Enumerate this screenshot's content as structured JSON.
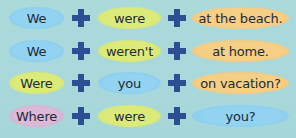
{
  "colors": {
    "background": "#a9d9da",
    "plus": "#2c4f93",
    "blue": "#93d3f2",
    "green": "#dcea7a",
    "orange": "#f6cf86",
    "pink": "#dcb9d8",
    "text": "#1e2a36"
  },
  "operator_icon": "plus-icon",
  "rows": [
    {
      "parts": [
        {
          "text": "We",
          "color": "blue"
        },
        {
          "text": "were",
          "color": "green"
        },
        {
          "text": "at the beach.",
          "color": "orange"
        }
      ]
    },
    {
      "parts": [
        {
          "text": "We",
          "color": "blue"
        },
        {
          "text": "weren't",
          "color": "green"
        },
        {
          "text": "at home.",
          "color": "orange"
        }
      ]
    },
    {
      "parts": [
        {
          "text": "Were",
          "color": "green"
        },
        {
          "text": "you",
          "color": "blue"
        },
        {
          "text": "on vacation?",
          "color": "orange"
        }
      ]
    },
    {
      "parts": [
        {
          "text": "Where",
          "color": "pink"
        },
        {
          "text": "were",
          "color": "green"
        },
        {
          "text": "you?",
          "color": "blue"
        }
      ]
    }
  ]
}
